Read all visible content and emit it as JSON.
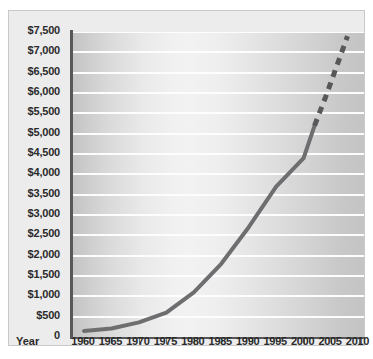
{
  "chart_data": {
    "type": "line",
    "title": "",
    "subtitle": "",
    "xlabel": "Year",
    "ylabel": "",
    "xlim": [
      1958,
      2011
    ],
    "ylim": [
      0,
      7500
    ],
    "grid": true,
    "legend": "none",
    "x_ticks": [
      "1960",
      "1965",
      "1970",
      "1975",
      "1980",
      "1985",
      "1990",
      "1995",
      "2000",
      "2005",
      "2010"
    ],
    "x_tick_values": [
      1960,
      1965,
      1970,
      1975,
      1980,
      1985,
      1990,
      1995,
      2000,
      2005,
      2010
    ],
    "y_ticks": [
      "0",
      "$500",
      "$1,000",
      "$1,500",
      "$2,000",
      "$2,500",
      "$3,000",
      "$3,500",
      "$4,000",
      "$4,500",
      "$5,000",
      "$5,500",
      "$6,000",
      "$6,500",
      "$7,000",
      "$7,500"
    ],
    "y_tick_values": [
      0,
      500,
      1000,
      1500,
      2000,
      2500,
      3000,
      3500,
      4000,
      4500,
      5000,
      5500,
      6000,
      6500,
      7000,
      7500
    ],
    "series": [
      {
        "name": "actual",
        "style": "solid",
        "color": "#6e6e70",
        "x": [
          1960,
          1965,
          1970,
          1975,
          1980,
          1985,
          1990,
          1995,
          2000,
          2001,
          2002
        ],
        "values": [
          150,
          210,
          360,
          600,
          1100,
          1800,
          2700,
          3700,
          4400,
          4800,
          5200
        ]
      },
      {
        "name": "projected",
        "style": "dashed",
        "color": "#58585a",
        "x": [
          2002,
          2004,
          2006,
          2008
        ],
        "values": [
          5200,
          5900,
          6650,
          7400
        ]
      }
    ],
    "colors": {
      "plot_background_dark": "#c3c3c3",
      "plot_background_light": "#f2f2f3",
      "gridline": "#fdfdfd",
      "axis": "#58585a",
      "line": "#6e6e70",
      "text": "#2b2b2b",
      "frame_background": "#ececed",
      "page_background": "#ffffff"
    }
  }
}
